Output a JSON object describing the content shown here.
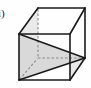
{
  "figure": {
    "label": "i)",
    "caption_visible": false,
    "background_color": "#fefefe",
    "solid_edge_color": "#1a1a1a",
    "hidden_edge_color": "#8a8a8a",
    "shaded_face_color": "#d9d9d9",
    "shaded_face_opacity": "1",
    "solid_edge_width": "1.6",
    "hidden_edge_width": "1.1",
    "hidden_edge_dash": "2.5,2",
    "projection": "oblique",
    "geometry": {
      "front_face": {
        "name": "front-square",
        "top_left": [
          19,
          34
        ],
        "top_right": [
          70,
          34
        ],
        "bottom_right": [
          70,
          80
        ],
        "bottom_left": [
          19,
          80
        ]
      },
      "back_face": {
        "name": "back-square",
        "top_left": [
          38,
          8
        ],
        "top_right": [
          85,
          8
        ],
        "bottom_right": [
          85,
          58
        ],
        "bottom_left": [
          38,
          58
        ]
      },
      "hidden_edges": [
        {
          "name": "back-bottom-left-vertical",
          "from": [
            38,
            8
          ],
          "to": [
            38,
            58
          ]
        },
        {
          "name": "back-bottom-horizontal",
          "from": [
            38,
            58
          ],
          "to": [
            85,
            58
          ]
        },
        {
          "name": "back-bottom-left-diagonal",
          "from": [
            19,
            80
          ],
          "to": [
            38,
            58
          ]
        }
      ],
      "shaded_triangle": {
        "name": "cross-section-triangle",
        "vertices": [
          [
            19,
            34
          ],
          [
            19,
            80
          ],
          [
            85,
            58
          ]
        ]
      },
      "accent_triangle": {
        "name": "lower-right-triangle",
        "vertices": [
          [
            70,
            80
          ],
          [
            85,
            58
          ],
          [
            70,
            66
          ]
        ]
      }
    }
  }
}
